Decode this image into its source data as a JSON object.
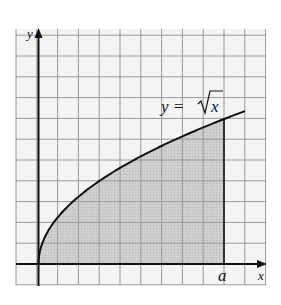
{
  "diagram": {
    "curve_label": "y = √x",
    "curve_label_prefix": "y =",
    "curve_label_radicand": "x",
    "x_axis_label": "x",
    "y_axis_label": "y",
    "bound_label": "a",
    "colors": {
      "grid": "#9a9a9a",
      "grid_bg": "#f4f4f4",
      "axis": "#111111",
      "curve": "#111111",
      "shade": "#c9c9c9"
    }
  },
  "chart_data": {
    "type": "area",
    "title": "",
    "function": "y = sqrt(x)",
    "shaded_region": {
      "from": 0,
      "to": "a"
    },
    "xlabel": "x",
    "ylabel": "y",
    "annotations": [
      "y = √x",
      "a"
    ],
    "grid": true
  }
}
